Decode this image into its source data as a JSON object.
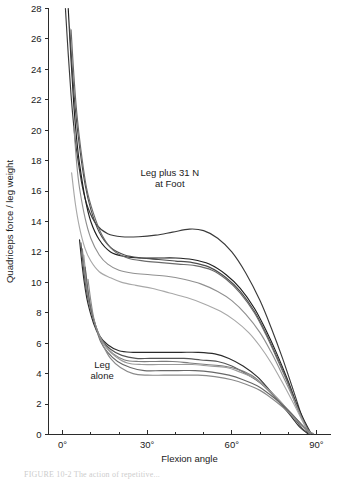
{
  "figure": {
    "caption_partial": "FIGURE 10-2  The action of repetitive...",
    "background_color": "#ffffff"
  },
  "chart_data": {
    "type": "line",
    "title": "",
    "xlabel": "Flexion angle",
    "ylabel": "Quadriceps force / leg weight",
    "xlim": [
      -5,
      95
    ],
    "ylim": [
      0,
      28
    ],
    "grid": false,
    "legend_position": "none",
    "xticks": [
      0,
      30,
      60,
      90
    ],
    "xtick_labels": [
      "0°",
      "30°",
      "60°",
      "90°"
    ],
    "xminor_ticks": [
      10,
      20,
      40,
      50,
      70,
      80
    ],
    "yticks": [
      0,
      2,
      4,
      6,
      8,
      10,
      12,
      14,
      16,
      18,
      20,
      22,
      24,
      26,
      28
    ],
    "ytick_labels": [
      "0",
      "2",
      "4",
      "6",
      "8",
      "10",
      "12",
      "14",
      "16",
      "18",
      "20",
      "22",
      "24",
      "26",
      "28"
    ],
    "annotations": [
      {
        "id": "upper-group-label",
        "text_line1": "Leg plus 31 N",
        "text_line2": "at Foot",
        "x": 38,
        "y": 17.0
      },
      {
        "id": "lower-group-label",
        "text_line1": "Leg",
        "text_line2": "alone",
        "x": 14,
        "y": 4.4
      }
    ],
    "series": [
      {
        "name": "loaded-1",
        "group": "Leg plus 31 N at Foot",
        "color": "#3a3a3a",
        "x": [
          1,
          2,
          3,
          4,
          5,
          7,
          9,
          12,
          16,
          21,
          27,
          33,
          39,
          45,
          50,
          55,
          60,
          65,
          70,
          74,
          78,
          82,
          85,
          87
        ],
        "y": [
          28.0,
          25.0,
          22.3,
          20.2,
          18.6,
          16.3,
          14.9,
          13.8,
          13.2,
          13.0,
          13.0,
          13.1,
          13.3,
          13.5,
          13.4,
          12.9,
          12.0,
          10.6,
          8.8,
          7.0,
          5.0,
          2.8,
          1.1,
          0.2
        ]
      },
      {
        "name": "loaded-2",
        "group": "Leg plus 31 N at Foot",
        "color": "#1f1f1f",
        "x": [
          2,
          3,
          4,
          5,
          6,
          8,
          10,
          13,
          17,
          22,
          28,
          34,
          40,
          46,
          52,
          58,
          63,
          68,
          72,
          76,
          80,
          83,
          86,
          88
        ],
        "y": [
          28.0,
          24.6,
          21.6,
          19.4,
          17.8,
          15.5,
          14.0,
          12.8,
          12.0,
          11.7,
          11.6,
          11.6,
          11.6,
          11.5,
          11.2,
          10.5,
          9.6,
          8.3,
          6.9,
          5.3,
          3.5,
          2.0,
          0.8,
          0.1
        ]
      },
      {
        "name": "loaded-3",
        "group": "Leg plus 31 N at Foot",
        "color": "#4c4c4c",
        "x": [
          2.5,
          3.5,
          4.5,
          6,
          8,
          10,
          13,
          17,
          22,
          28,
          34,
          40,
          46,
          52,
          58,
          63,
          68,
          72,
          76,
          80,
          83,
          86,
          88
        ],
        "y": [
          26.7,
          23.8,
          21.4,
          18.9,
          16.4,
          14.8,
          13.3,
          12.3,
          11.8,
          11.6,
          11.5,
          11.4,
          11.3,
          11.0,
          10.3,
          9.4,
          8.1,
          6.7,
          5.1,
          3.4,
          1.9,
          0.7,
          0.1
        ]
      },
      {
        "name": "loaded-4",
        "group": "Leg plus 31 N at Foot",
        "color": "#6b6b6b",
        "x": [
          3,
          4,
          5,
          6.5,
          8.5,
          11,
          14,
          18,
          23,
          29,
          35,
          41,
          47,
          53,
          58,
          63,
          68,
          72,
          76,
          80,
          83,
          86,
          88
        ],
        "y": [
          26.6,
          23.6,
          21.2,
          18.7,
          16.2,
          14.5,
          13.1,
          12.1,
          11.6,
          11.4,
          11.3,
          11.2,
          11.1,
          10.8,
          10.2,
          9.3,
          8.0,
          6.6,
          5.0,
          3.3,
          1.8,
          0.6,
          0.1
        ]
      },
      {
        "name": "loaded-5",
        "group": "Leg plus 31 N at Foot",
        "color": "#909090",
        "x": [
          4,
          5,
          6,
          8,
          10,
          13,
          16,
          20,
          25,
          31,
          37,
          43,
          49,
          55,
          60,
          65,
          70,
          74,
          78,
          82,
          85,
          87
        ],
        "y": [
          20.2,
          17.8,
          16.2,
          14.2,
          12.9,
          11.8,
          11.2,
          10.8,
          10.6,
          10.5,
          10.4,
          10.2,
          9.9,
          9.4,
          8.8,
          7.9,
          6.7,
          5.4,
          3.9,
          2.3,
          1.0,
          0.2
        ]
      },
      {
        "name": "loaded-6",
        "group": "Leg plus 31 N at Foot",
        "color": "#a8a8a8",
        "x": [
          3.2,
          4.5,
          6,
          8,
          10,
          13,
          17,
          21,
          26,
          32,
          38,
          44,
          50,
          56,
          61,
          66,
          70,
          74,
          78,
          82,
          85,
          87
        ],
        "y": [
          17.2,
          15.2,
          13.6,
          12.2,
          11.4,
          10.7,
          10.3,
          10.0,
          9.8,
          9.6,
          9.3,
          9.0,
          8.6,
          8.1,
          7.5,
          6.7,
          5.8,
          4.7,
          3.4,
          2.0,
          0.9,
          0.2
        ]
      },
      {
        "name": "unloaded-1",
        "group": "Leg alone",
        "color": "#2b2b2b",
        "x": [
          6,
          7,
          8,
          9,
          11,
          13,
          16,
          20,
          25,
          30,
          36,
          42,
          48,
          54,
          59,
          64,
          69,
          73,
          77,
          81,
          84,
          87
        ],
        "y": [
          12.8,
          11.0,
          9.6,
          8.6,
          7.3,
          6.5,
          5.9,
          5.5,
          5.4,
          5.4,
          5.4,
          5.4,
          5.4,
          5.3,
          5.0,
          4.5,
          3.8,
          3.0,
          2.1,
          1.2,
          0.5,
          0.05
        ]
      },
      {
        "name": "unloaded-2",
        "group": "Leg alone",
        "color": "#555555",
        "x": [
          6.5,
          7.5,
          8.5,
          10,
          12,
          14,
          17,
          21,
          26,
          31,
          37,
          43,
          49,
          55,
          60,
          65,
          70,
          74,
          78,
          82,
          85,
          87.5
        ],
        "y": [
          12.6,
          10.8,
          9.4,
          8.2,
          7.0,
          6.2,
          5.6,
          5.2,
          5.0,
          5.0,
          5.0,
          5.0,
          4.9,
          4.8,
          4.5,
          4.0,
          3.4,
          2.7,
          1.9,
          1.1,
          0.4,
          0.05
        ]
      },
      {
        "name": "unloaded-3",
        "group": "Leg alone",
        "color": "#7d7d7d",
        "x": [
          7,
          8,
          9,
          10.5,
          12.5,
          15,
          18,
          22,
          27,
          33,
          39,
          45,
          51,
          57,
          62,
          67,
          71,
          75,
          79,
          83,
          86,
          88
        ],
        "y": [
          12.2,
          10.4,
          9.1,
          7.9,
          6.7,
          5.9,
          5.3,
          4.9,
          4.8,
          4.8,
          4.8,
          4.7,
          4.6,
          4.5,
          4.3,
          3.9,
          3.3,
          2.6,
          1.8,
          1.0,
          0.4,
          0.05
        ]
      },
      {
        "name": "unloaded-4",
        "group": "Leg alone",
        "color": "#9a9a9a",
        "x": [
          7.5,
          8.5,
          9.5,
          11,
          13,
          15.5,
          19,
          23,
          28,
          34,
          40,
          46,
          52,
          58,
          63,
          68,
          72,
          76,
          80,
          84,
          86.5,
          88
        ],
        "y": [
          11.8,
          10.1,
          8.8,
          7.6,
          6.5,
          5.7,
          5.1,
          4.7,
          4.6,
          4.6,
          4.6,
          4.6,
          4.5,
          4.4,
          4.1,
          3.7,
          3.1,
          2.4,
          1.6,
          0.8,
          0.3,
          0.05
        ]
      },
      {
        "name": "unloaded-5",
        "group": "Leg alone",
        "color": "#686868",
        "x": [
          8,
          9,
          10,
          11.5,
          13.5,
          16,
          19.5,
          24,
          29,
          35,
          41,
          47,
          53,
          59,
          64,
          69,
          73,
          77,
          81,
          84.5,
          87,
          88.5
        ],
        "y": [
          11.0,
          9.5,
          8.3,
          7.2,
          6.1,
          5.4,
          4.8,
          4.4,
          4.2,
          4.2,
          4.2,
          4.2,
          4.1,
          3.9,
          3.6,
          3.2,
          2.7,
          2.1,
          1.4,
          0.7,
          0.25,
          0.05
        ]
      },
      {
        "name": "unloaded-6",
        "group": "Leg alone",
        "color": "#8a8a8a",
        "x": [
          9,
          10,
          11,
          12.5,
          14.5,
          17,
          20.5,
          25,
          30,
          36,
          42,
          48,
          54,
          60,
          65,
          70,
          74,
          78,
          82,
          85,
          87.5,
          89
        ],
        "y": [
          10.2,
          8.8,
          7.7,
          6.7,
          5.8,
          5.0,
          4.4,
          4.0,
          3.9,
          3.9,
          3.9,
          3.9,
          3.8,
          3.6,
          3.3,
          2.9,
          2.4,
          1.8,
          1.1,
          0.55,
          0.2,
          0.05
        ]
      }
    ]
  }
}
